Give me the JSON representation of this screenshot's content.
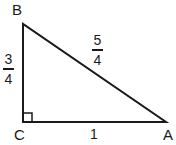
{
  "diagram": {
    "type": "right-triangle",
    "vertices": [
      {
        "id": "B",
        "label": "B",
        "x": 23,
        "y": 24
      },
      {
        "id": "C",
        "label": "C",
        "x": 23,
        "y": 122
      },
      {
        "id": "A",
        "label": "A",
        "x": 166,
        "y": 122
      }
    ],
    "right_angle_at": "C",
    "sides": {
      "BC": {
        "numerator": "3",
        "denominator": "4"
      },
      "BA": {
        "numerator": "5",
        "denominator": "4"
      },
      "CA": {
        "value": "1"
      }
    },
    "colors": {
      "stroke": "#1a1a1a",
      "background": "#ffffff"
    }
  }
}
